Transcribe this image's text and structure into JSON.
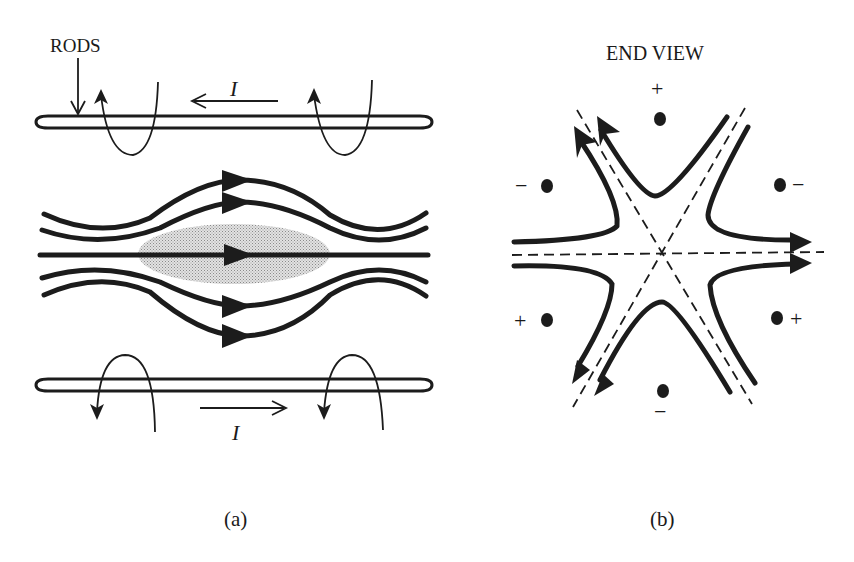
{
  "figure": {
    "panel_a": {
      "caption": "(a)",
      "rods_label": "RODS",
      "current_top_label": "I",
      "current_bottom_label": "I",
      "current_top_direction": "left",
      "current_bottom_direction": "right",
      "shaded_region": "plasma/beam region (stippled ellipse)"
    },
    "panel_b": {
      "title": "END VIEW",
      "caption": "(b)",
      "pole_signs": {
        "top": "+",
        "upper_left": "−",
        "upper_right": "−",
        "lower_left": "+",
        "lower_right": "+",
        "bottom": "−"
      }
    }
  },
  "colors": {
    "ink": "#1c1c1c",
    "background": "#ffffff",
    "shading": "#bdbdbd"
  }
}
